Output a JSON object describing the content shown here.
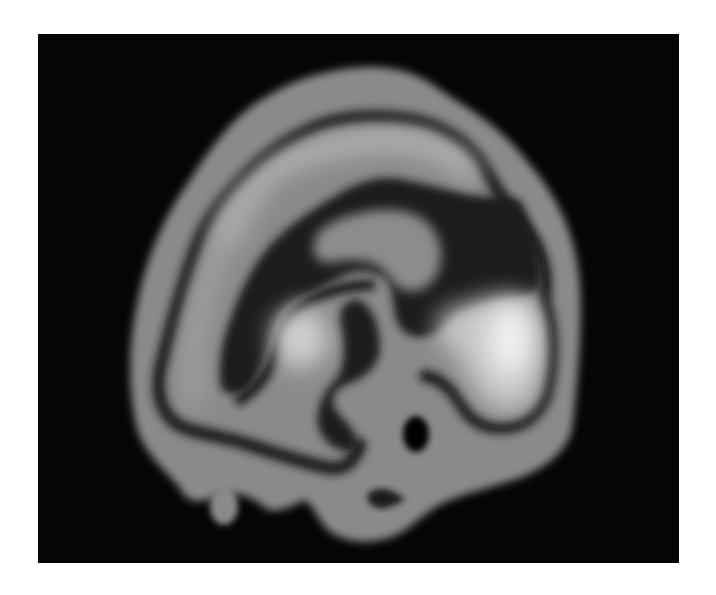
{
  "image": {
    "type": "medical-scan",
    "modality_appearance": "grayscale brain perfusion scan, sagittal view",
    "description": "Sagittal cross-section of a brain scan on a black background with gray cortex, dark bands and bright high-uptake regions",
    "caption": ""
  },
  "colors": {
    "page_background": "#ffffff",
    "panel_background": "#050505",
    "tissue_gray": "#8a8a8a",
    "dark_band": "#1c1c1c",
    "bright_region": "#c8c8c8",
    "brightest_region": "#f0f0f0",
    "hole": "#020202"
  }
}
